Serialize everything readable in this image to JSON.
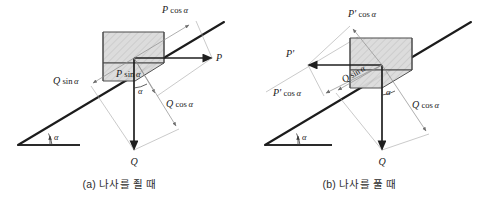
{
  "figure": {
    "type": "force-decomposition-diagram",
    "background_color": "#ffffff",
    "ink_color": "#1a1a1a",
    "accent_gray": "#8c8c8c",
    "box_fill": "#d9d9d9"
  },
  "panels": [
    {
      "id": "a",
      "caption": "(a) 나사를 죌 때",
      "incline_angle_label": "α",
      "labels": {
        "p_cos_alpha": {
          "var": "P",
          "fn": "cos",
          "ang": "α"
        },
        "p": {
          "var": "P"
        },
        "p_sin_alpha": {
          "var": "P",
          "fn": "sin",
          "ang": "α"
        },
        "q_sin_alpha": {
          "var": "Q",
          "fn": "sin",
          "ang": "α"
        },
        "q_cos_alpha": {
          "var": "Q",
          "fn": "cos",
          "ang": "α"
        },
        "q": {
          "var": "Q"
        },
        "alpha_incline": "α",
        "alpha_inner": "α"
      }
    },
    {
      "id": "b",
      "caption": "(b) 나사를 풀 때",
      "incline_angle_label": "α",
      "labels": {
        "pp_cos_alpha_top": {
          "var": "P'",
          "fn": "cos",
          "ang": "α"
        },
        "pp": {
          "var": "P'"
        },
        "pp_cos_alpha_low": {
          "var": "P'",
          "fn": "cos",
          "ang": "α"
        },
        "q_sin_alpha": {
          "var": "Q",
          "fn": "sin",
          "ang": "α"
        },
        "q_cos_alpha": {
          "var": "Q",
          "fn": "cos",
          "ang": "α"
        },
        "q": {
          "var": "Q"
        },
        "alpha_incline": "α",
        "alpha_inner": "α"
      }
    }
  ]
}
